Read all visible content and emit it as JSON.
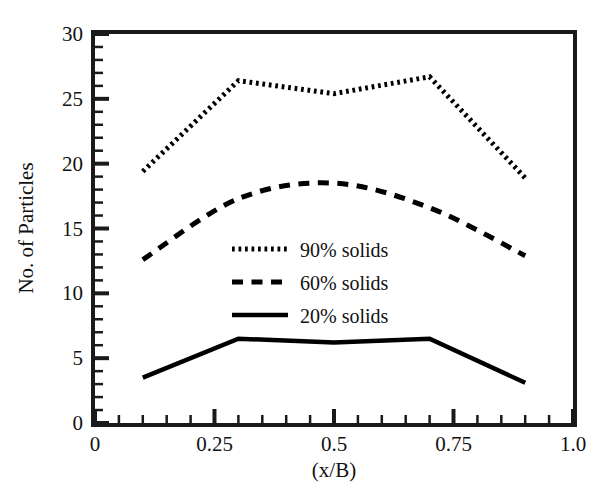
{
  "chart_data": {
    "type": "line",
    "title": "",
    "xlabel": "(x/B)",
    "ylabel": "No. of Particles",
    "xlim": [
      0,
      1.0
    ],
    "ylim": [
      0,
      30
    ],
    "grid": false,
    "legend_position": "center",
    "x_ticks": [
      {
        "value": 0,
        "label": "0"
      },
      {
        "value": 0.25,
        "label": "0.25"
      },
      {
        "value": 0.5,
        "label": "0.5"
      },
      {
        "value": 0.75,
        "label": "0.75"
      },
      {
        "value": 1.0,
        "label": "1.0"
      }
    ],
    "x_minor_step": 0.05,
    "y_ticks": [
      {
        "value": 0,
        "label": "0"
      },
      {
        "value": 5,
        "label": "5"
      },
      {
        "value": 10,
        "label": "10"
      },
      {
        "value": 15,
        "label": "15"
      },
      {
        "value": 20,
        "label": "20"
      },
      {
        "value": 25,
        "label": "25"
      },
      {
        "value": 30,
        "label": "30"
      }
    ],
    "y_minor_step": 1,
    "x": [
      0.1,
      0.3,
      0.5,
      0.7,
      0.9
    ],
    "series": [
      {
        "name": "90% solids",
        "style": "dotted",
        "color": "#000000",
        "smooth": false,
        "values": [
          19.4,
          26.4,
          25.4,
          26.7,
          18.9
        ]
      },
      {
        "name": "60% solids",
        "style": "dashed",
        "color": "#000000",
        "smooth": true,
        "values": [
          12.6,
          17.3,
          18.5,
          16.6,
          12.9
        ]
      },
      {
        "name": "20% solids",
        "style": "solid",
        "color": "#000000",
        "smooth": false,
        "values": [
          3.5,
          6.5,
          6.2,
          6.5,
          3.1
        ]
      }
    ]
  },
  "legend": {
    "entries": [
      {
        "label": "90% solids",
        "style": "dotted"
      },
      {
        "label": "60% solids",
        "style": "dashed"
      },
      {
        "label": "20% solids",
        "style": "solid"
      }
    ]
  }
}
